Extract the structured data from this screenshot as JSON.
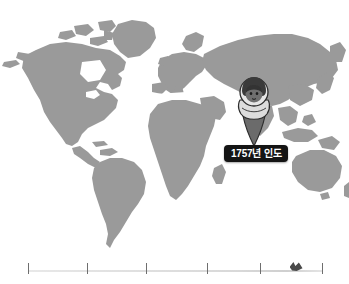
{
  "scene": {
    "title": "world-map-timeline-slide",
    "background_color": "#ffffff"
  },
  "map": {
    "name": "world-map",
    "projection": "equirectangular",
    "land_color": "#9a9a9a",
    "ocean_color": "#ffffff"
  },
  "marker": {
    "name": "location-pin-marker",
    "type": "map-pin",
    "fill_color": "#3c3c3c",
    "avatar": {
      "icon": "person-with-head-covering-icon",
      "face_color": "#5e5e5e",
      "covering_color": "#e4e4e4"
    },
    "anchor_region": "India"
  },
  "label": {
    "text": "1757년 인도",
    "background_color": "#141414",
    "text_color": "#ffffff"
  },
  "timeline": {
    "name": "history-timeline",
    "ticks": [
      {
        "position_pct": 0
      },
      {
        "position_pct": 20
      },
      {
        "position_pct": 40
      },
      {
        "position_pct": 61
      },
      {
        "position_pct": 79
      },
      {
        "position_pct": 100
      }
    ],
    "cursor_position_pct": 91,
    "track_color": "#dddddd",
    "tick_color": "#6e6e6e"
  }
}
